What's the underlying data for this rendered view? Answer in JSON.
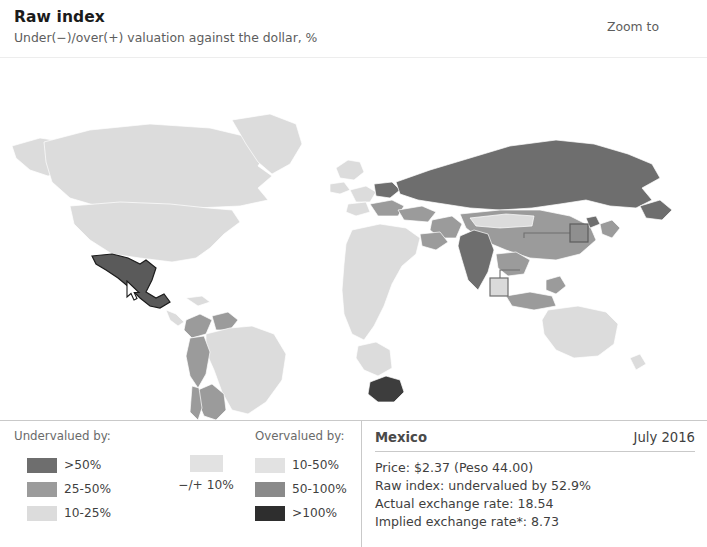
{
  "header": {
    "title": "Raw index",
    "subtitle": "Under(−)/over(+) valuation against the dollar, %",
    "zoom_to_label": "Zoom to",
    "zoom_to_icon": "triangle-down-icon"
  },
  "legend": {
    "undervalued_heading": "Undervalued by:",
    "overvalued_heading": "Overvalued by:",
    "neutral_label": "−/+ 10%",
    "neutral_color": "#e2e2e2",
    "undervalued": [
      {
        "label": ">50%",
        "color": "#6e6e6e"
      },
      {
        "label": "25-50%",
        "color": "#9b9b9b"
      },
      {
        "label": "10-25%",
        "color": "#dcdcdc"
      }
    ],
    "overvalued": [
      {
        "label": "10-50%",
        "color": "#e2e2e2"
      },
      {
        "label": "50-100%",
        "color": "#8a8a8a"
      },
      {
        "label": ">100%",
        "color": "#2e2e2e"
      }
    ]
  },
  "info": {
    "country": "Mexico",
    "date": "July 2016",
    "lines": [
      "Price: $2.37 (Peso 44.00)",
      "Raw index: undervalued by 52.9%",
      "Actual exchange rate: 18.54",
      "Implied exchange rate*: 8.73"
    ]
  },
  "map": {
    "selected_country": "Mexico",
    "cursor_icon": "mouse-pointer-icon",
    "callouts": [
      {
        "name": "hong-kong-callout",
        "shade": "dark"
      },
      {
        "name": "singapore-callout",
        "shade": "light"
      }
    ]
  }
}
